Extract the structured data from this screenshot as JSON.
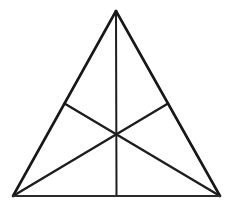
{
  "figure": {
    "background_color": "#ffffff",
    "stroke_color": "#171717",
    "base_stroke_color": "#2b2b2b",
    "median_stroke_color": "#1d1d1d",
    "canvas": {
      "width": 233,
      "height": 206
    }
  },
  "chart_data": {
    "type": "diagram",
    "shape": "triangle",
    "points": {
      "apex": {
        "label": "apex",
        "x": 116,
        "y": 11
      },
      "bottom_left": {
        "label": "bottom-left vertex",
        "x": 13,
        "y": 196
      },
      "bottom_right": {
        "label": "bottom-right vertex",
        "x": 220,
        "y": 196
      },
      "left_midpoint": {
        "label": "midpoint of left side",
        "x": 64.5,
        "y": 103.5
      },
      "right_midpoint": {
        "label": "midpoint of right side",
        "x": 168,
        "y": 103.5
      },
      "base_midpoint": {
        "label": "midpoint of base",
        "x": 116.5,
        "y": 196
      },
      "centroid": {
        "label": "centroid",
        "x": 116.3,
        "y": 134.3
      }
    },
    "edges": [
      {
        "name": "left-side",
        "from": "apex",
        "to": "bottom_left",
        "width": 2.6
      },
      {
        "name": "right-side",
        "from": "apex",
        "to": "bottom_right",
        "width": 2.6
      },
      {
        "name": "base-side",
        "from": "bottom_left",
        "to": "bottom_right",
        "width": 2.0
      }
    ],
    "medians": [
      {
        "name": "median-apex-to-base",
        "from": "apex",
        "to": "base_midpoint",
        "width": 2.0
      },
      {
        "name": "median-bottomleft-to-right",
        "from": "bottom_left",
        "to": "right_midpoint",
        "width": 2.4
      },
      {
        "name": "median-bottomright-to-left",
        "from": "bottom_right",
        "to": "left_midpoint",
        "width": 2.4
      }
    ],
    "regions_count": 6,
    "labels": [],
    "annotations": []
  }
}
